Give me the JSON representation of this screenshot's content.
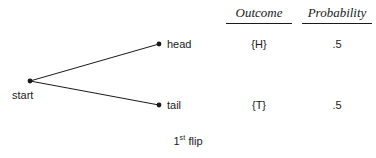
{
  "diagram": {
    "nodes": {
      "start": {
        "label": "start",
        "x": 30,
        "y": 81
      },
      "head": {
        "label": "head",
        "x": 159,
        "y": 44
      },
      "tail": {
        "label": "tail",
        "x": 159,
        "y": 105
      }
    },
    "edges": [
      {
        "from": "start",
        "to": "head"
      },
      {
        "from": "start",
        "to": "tail"
      }
    ],
    "line_color": "#1a1a1a",
    "node_color": "#1a1a1a",
    "caption": {
      "number": "1",
      "ordinal_suffix": "st",
      "word": "flip"
    }
  },
  "table": {
    "headers": {
      "outcome": "Outcome",
      "probability": "Probability"
    },
    "rows": [
      {
        "branch": "head",
        "outcome": "{H}",
        "probability": ".5"
      },
      {
        "branch": "tail",
        "outcome": "{T}",
        "probability": ".5"
      }
    ]
  }
}
